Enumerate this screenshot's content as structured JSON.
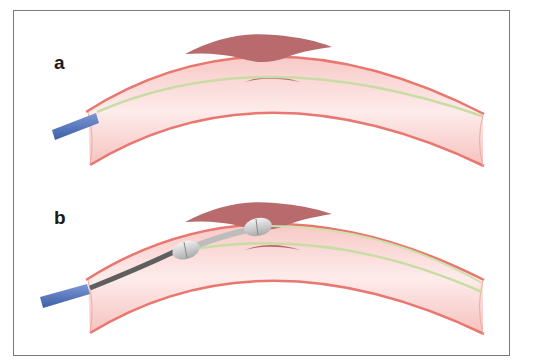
{
  "figure": {
    "panels": [
      {
        "label": "a",
        "description": "Curved vessel with plaque lesions, guidewire crossing lesion, catheter at entry"
      },
      {
        "label": "b",
        "description": "Curved vessel with plaque lesions, dual-balloon catheter advanced over guidewire across lesion"
      }
    ],
    "colors": {
      "vessel_wall": "#e9766f",
      "vessel_lumen": "#fbe0de",
      "plaque": "#b86a6c",
      "guidewire": "#c9dca3",
      "catheter_sheath": "#4f72b8",
      "catheter_shaft": "#5f5f5f",
      "balloon": "#d9d9d9",
      "frame_border": "#7a7a7a"
    }
  }
}
